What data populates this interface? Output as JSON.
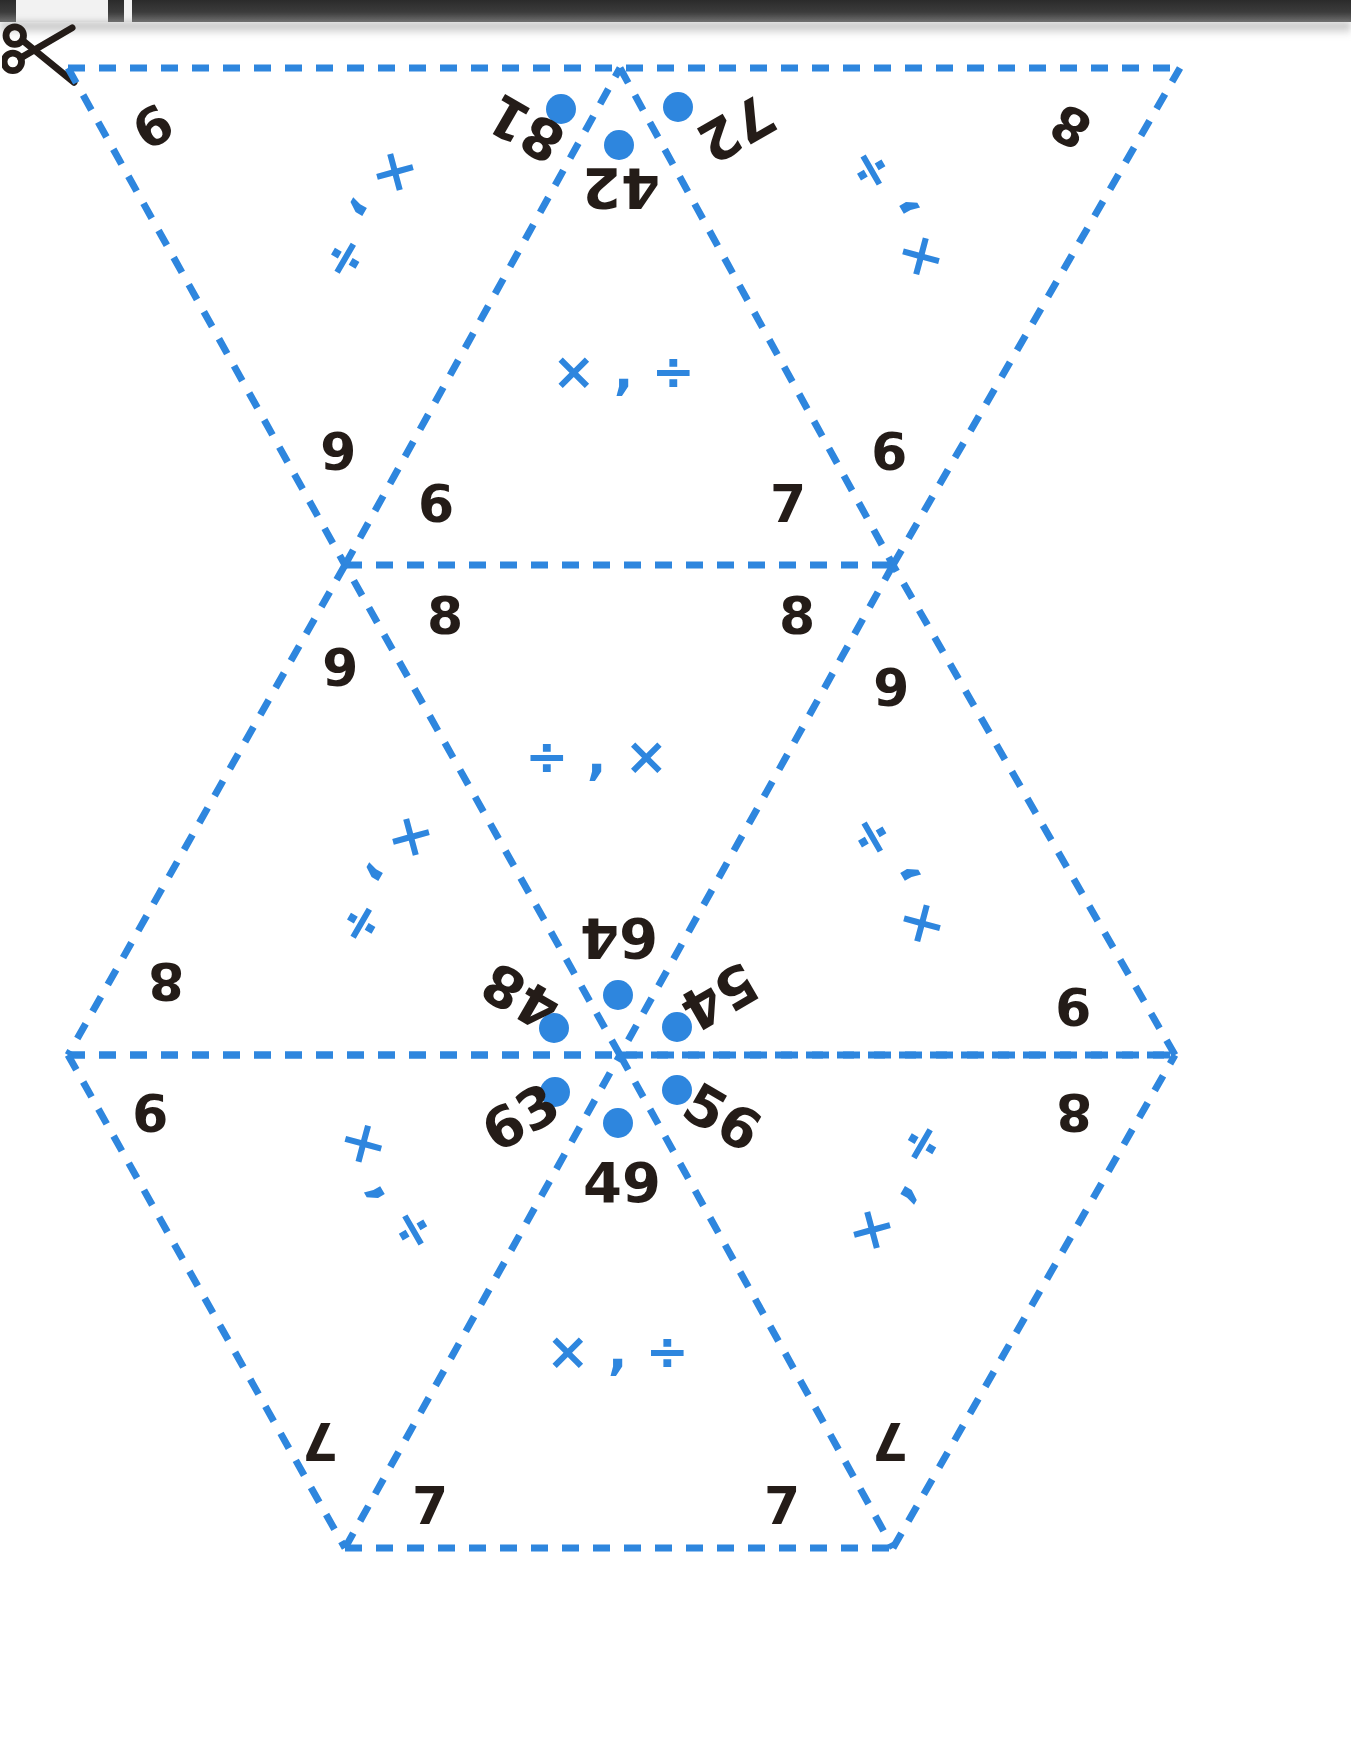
{
  "page": {
    "width": 1351,
    "height": 1763,
    "background": "#ffffff"
  },
  "colors": {
    "fold_line": "#2e86de",
    "accent_blue": "#2e86de",
    "ink_black": "#241c18",
    "scanner_bar": "#2b2b2b"
  },
  "icons": {
    "scissors": "scissors-icon",
    "scissors_label": "cut along dashed line"
  },
  "operators": {
    "times_then_divide": "× , ÷",
    "divide_then_times": "÷ , ×",
    "times": "×",
    "divide": "÷",
    "comma": ","
  },
  "top_cluster": {
    "products": [
      "81",
      "42",
      "72"
    ],
    "dots": 3
  },
  "center_cluster": {
    "products": [
      "48",
      "64",
      "54",
      "56",
      "49",
      "63"
    ],
    "dots": 6
  },
  "corner_numbers": {
    "row1": [
      "9",
      "6",
      "9",
      "8"
    ],
    "row2": [
      "6",
      "7"
    ],
    "row3": [
      "8",
      "8"
    ],
    "row4": [
      "6",
      "6"
    ],
    "row5": [
      "8",
      "9"
    ],
    "row6": [
      "9",
      "8"
    ],
    "row7": [
      "7",
      "7",
      "7",
      "7"
    ]
  },
  "faces": [
    {
      "id": "face-top-left",
      "operators": "× , ÷",
      "numbers": [
        "9",
        "6"
      ]
    },
    {
      "id": "face-top-center",
      "operators": "× , ÷",
      "numbers": [
        "6",
        "7"
      ]
    },
    {
      "id": "face-top-right",
      "operators": "× , ÷",
      "numbers": [
        "9",
        "8"
      ]
    },
    {
      "id": "face-mid-left",
      "operators": "× , ÷",
      "numbers": [
        "6",
        "8"
      ]
    },
    {
      "id": "face-mid-center",
      "operators": "÷ , ×",
      "numbers": [
        "8",
        "8"
      ]
    },
    {
      "id": "face-mid-right",
      "operators": "× , ÷",
      "numbers": [
        "6",
        "9"
      ]
    },
    {
      "id": "face-bot-left",
      "operators": "× , ÷",
      "numbers": [
        "9",
        "7"
      ]
    },
    {
      "id": "face-bot-center",
      "operators": "× , ÷",
      "numbers": [
        "7",
        "7"
      ]
    },
    {
      "id": "face-bot-right",
      "operators": "× , ÷",
      "numbers": [
        "8",
        "7"
      ]
    }
  ],
  "labels": {
    "n_9a": "9",
    "n_6a": "6",
    "n_9b": "9",
    "n_8a": "8",
    "n_6b": "6",
    "n_7a": "7",
    "n_8b": "8",
    "n_8c": "8",
    "n_6c": "6",
    "n_6d": "6",
    "n_8d": "8",
    "n_9c": "9",
    "n_9d": "9",
    "n_8e": "8",
    "n_7b": "7",
    "n_7c": "7",
    "n_7d": "7",
    "n_7e": "7",
    "p_81": "81",
    "p_42": "42",
    "p_72": "72",
    "p_48": "48",
    "p_64": "64",
    "p_54": "54",
    "p_63": "63",
    "p_49": "49",
    "p_56": "56",
    "op_a": "× , ÷",
    "op_b": "× , ÷",
    "op_c": "× , ÷",
    "op_d": "× , ÷",
    "op_e": "÷ , ×",
    "op_f": "× , ÷",
    "op_g": "× , ÷",
    "op_h": "× , ÷",
    "op_i": "× , ÷"
  }
}
